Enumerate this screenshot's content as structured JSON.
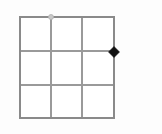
{
  "canvas": {
    "width": 162,
    "height": 134,
    "background_color": "#fdfdfd",
    "title": ""
  },
  "grid": {
    "name": "3x3-grid",
    "columns": 3,
    "rows": 3,
    "left": 20,
    "top": 17,
    "right": 114,
    "bottom": 118,
    "cell_width": 31.3,
    "cell_height": 33.7,
    "border_color": "#8a8a8a",
    "border_width": 1.4,
    "inner_line_color": "#9a9a9a",
    "inner_line_width": 1.2,
    "cell_fill": "#ffffff",
    "vertical_line_x": [
      51,
      82
    ],
    "horizontal_line_y": [
      51,
      85
    ]
  },
  "markers": [
    {
      "name": "top-circle-marker",
      "shape": "circle",
      "x": 51,
      "y": 17,
      "size": 5,
      "fill_color": "#c9c9c9",
      "stroke_color": "#b0b0b0",
      "label": "",
      "edge": "top"
    },
    {
      "name": "right-diamond-marker",
      "shape": "diamond",
      "x": 114,
      "y": 52,
      "size": 11,
      "fill_color": "#111111",
      "stroke_color": "#111111",
      "label": "",
      "edge": "right"
    }
  ]
}
